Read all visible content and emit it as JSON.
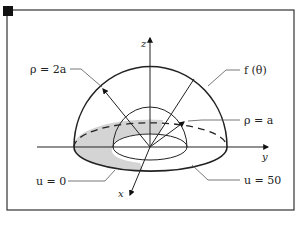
{
  "figure": {
    "type": "hemispherical shell (steady-state temperature problem)",
    "axes": {
      "z_label": "z",
      "y_label": "y",
      "x_label": "x"
    },
    "labels": {
      "outer_radius": "ρ = 2a",
      "inner_radius": "ρ = a",
      "outer_boundary": "f (θ)",
      "base_condition": "u = 0",
      "inner_condition": "u = 50"
    },
    "colors": {
      "stroke": "#222222",
      "shaded_base": "#d4d4d4",
      "leader_line": "#555555",
      "frame": "#333333",
      "corner_marker": "#111111"
    }
  }
}
